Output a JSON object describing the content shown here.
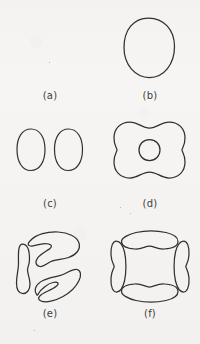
{
  "figure": {
    "background_color": "#f6f5f3",
    "stroke_color": "#332f2d",
    "label_color": "#413f3d",
    "width": 200,
    "height": 344,
    "kind": "line-drawing-panel-figure"
  },
  "panels": [
    {
      "id": "a",
      "caption": "(a)",
      "shape_count": 0,
      "shape_kind": "empty",
      "shape_description": "Blank panel, no contour drawn"
    },
    {
      "id": "b",
      "caption": "(b)",
      "shape_count": 1,
      "shape_kind": "oval",
      "shape_description": "Single large vertical oval outline"
    },
    {
      "id": "c",
      "caption": "(c)",
      "shape_count": 2,
      "shape_kind": "ellipse-pair",
      "shape_description": "Two small vertical ellipses side by side"
    },
    {
      "id": "d",
      "caption": "(d)",
      "shape_count": 2,
      "shape_kind": "pillow-with-inner-circle",
      "shape_description": "Rounded pillow outline pinched top and bottom, with a small circle at its centre"
    },
    {
      "id": "e",
      "caption": "(e)",
      "shape_count": 3,
      "shape_kind": "three-lobed-pinwheel",
      "shape_description": "Three crescent lobes in three-fold pinwheel arrangement around an empty centre"
    },
    {
      "id": "f",
      "caption": "(f)",
      "shape_count": 4,
      "shape_kind": "four-lobed-cross",
      "shape_description": "Four bean shaped lobes placed top, bottom, left and right around an empty centre"
    }
  ]
}
